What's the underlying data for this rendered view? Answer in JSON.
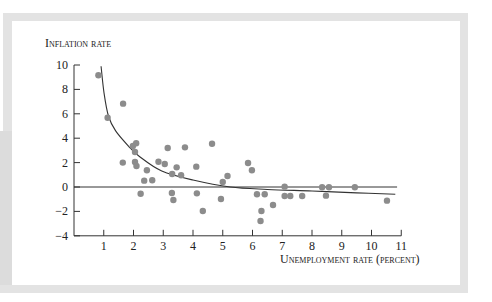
{
  "chart_data": {
    "type": "scatter",
    "title": "",
    "xlabel": "Unemployment rate (percent)",
    "ylabel": "Inflation rate",
    "xlim": [
      0,
      11
    ],
    "ylim": [
      -4,
      10
    ],
    "xticks": [
      1,
      2,
      3,
      4,
      5,
      6,
      7,
      8,
      9,
      10,
      11
    ],
    "yticks": [
      10,
      8,
      6,
      4,
      2,
      0,
      -2,
      -4
    ],
    "xtick_labels": [
      "1",
      "2",
      "3",
      "4",
      "5",
      "6",
      "7",
      "8",
      "9",
      "10",
      "11"
    ],
    "ytick_labels": [
      "10",
      "8",
      "6",
      "4",
      "2",
      "0",
      "−2",
      "−4"
    ],
    "grid": false,
    "legend": null,
    "zero_line": {
      "y": 0,
      "x_from": 0,
      "x_to": 10.86
    },
    "series": [
      {
        "name": "Observations",
        "kind": "scatter",
        "color": "#8c8c8c",
        "points": [
          [
            0.82,
            9.16
          ],
          [
            1.13,
            5.68
          ],
          [
            1.65,
            6.83
          ],
          [
            1.64,
            2.0
          ],
          [
            1.98,
            3.36
          ],
          [
            2.09,
            3.58
          ],
          [
            2.05,
            2.87
          ],
          [
            2.05,
            2.05
          ],
          [
            2.1,
            1.72
          ],
          [
            2.45,
            1.37
          ],
          [
            2.36,
            0.52
          ],
          [
            2.63,
            0.55
          ],
          [
            2.24,
            -0.55
          ],
          [
            2.84,
            2.07
          ],
          [
            3.05,
            1.89
          ],
          [
            3.15,
            3.2
          ],
          [
            3.73,
            3.25
          ],
          [
            3.45,
            1.61
          ],
          [
            3.3,
            1.07
          ],
          [
            3.6,
            0.96
          ],
          [
            3.29,
            -0.49
          ],
          [
            3.34,
            -1.07
          ],
          [
            4.64,
            3.55
          ],
          [
            4.11,
            1.67
          ],
          [
            4.13,
            -0.52
          ],
          [
            4.33,
            -1.97
          ],
          [
            5.0,
            0.41
          ],
          [
            5.16,
            0.9
          ],
          [
            4.94,
            -0.98
          ],
          [
            5.85,
            1.97
          ],
          [
            5.98,
            1.37
          ],
          [
            6.15,
            -0.6
          ],
          [
            6.41,
            -0.6
          ],
          [
            6.3,
            -1.97
          ],
          [
            6.27,
            -2.79
          ],
          [
            6.69,
            -1.48
          ],
          [
            7.08,
            0.03
          ],
          [
            7.08,
            -0.74
          ],
          [
            7.27,
            -0.74
          ],
          [
            7.67,
            -0.74
          ],
          [
            8.34,
            -0.02
          ],
          [
            8.57,
            -0.02
          ],
          [
            8.47,
            -0.71
          ],
          [
            9.44,
            -0.02
          ],
          [
            10.52,
            -1.12
          ]
        ]
      },
      {
        "name": "Phillips curve (fitted)",
        "kind": "line",
        "color": "#333333",
        "points": [
          [
            0.91,
            9.9
          ],
          [
            1.01,
            7.7
          ],
          [
            1.16,
            5.8
          ],
          [
            1.4,
            4.6
          ],
          [
            1.83,
            3.36
          ],
          [
            2.2,
            2.5
          ],
          [
            2.95,
            1.31
          ],
          [
            4.0,
            0.57
          ],
          [
            5.25,
            0.0
          ],
          [
            6.5,
            -0.2
          ],
          [
            8.0,
            -0.33
          ],
          [
            9.5,
            -0.48
          ],
          [
            10.8,
            -0.6
          ]
        ]
      }
    ]
  },
  "labels": {
    "ylabel": "Inflation rate",
    "xlabel": "Unemployment rate (percent)"
  }
}
